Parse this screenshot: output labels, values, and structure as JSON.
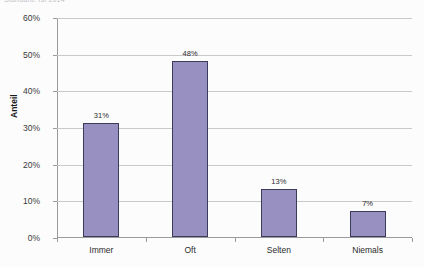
{
  "title_strip": {
    "text": "Standard: Ist 2014"
  },
  "chart_data": {
    "type": "bar",
    "title": "",
    "xlabel": "",
    "ylabel": "Anteil",
    "categories": [
      "Immer",
      "Oft",
      "Selten",
      "Niemals"
    ],
    "values": [
      31,
      48,
      13,
      7
    ],
    "data_labels": [
      "31%",
      "48%",
      "13%",
      "7%"
    ],
    "ylim": [
      0,
      60
    ],
    "ytick_values": [
      0,
      10,
      20,
      30,
      40,
      50,
      60
    ],
    "ytick_labels": [
      "0%",
      "10%",
      "20%",
      "30%",
      "40%",
      "50%",
      "60%"
    ],
    "grid": true,
    "legend": false,
    "series": [
      {
        "name": "Anteil",
        "values": [
          31,
          48,
          13,
          7
        ]
      }
    ],
    "colors": {
      "bar_fill": "#9990c2",
      "bar_border": "#3b3b5c",
      "gridline": "#c9c9c9",
      "axis": "#9a9a9a",
      "text": "#2b2b2b"
    }
  }
}
